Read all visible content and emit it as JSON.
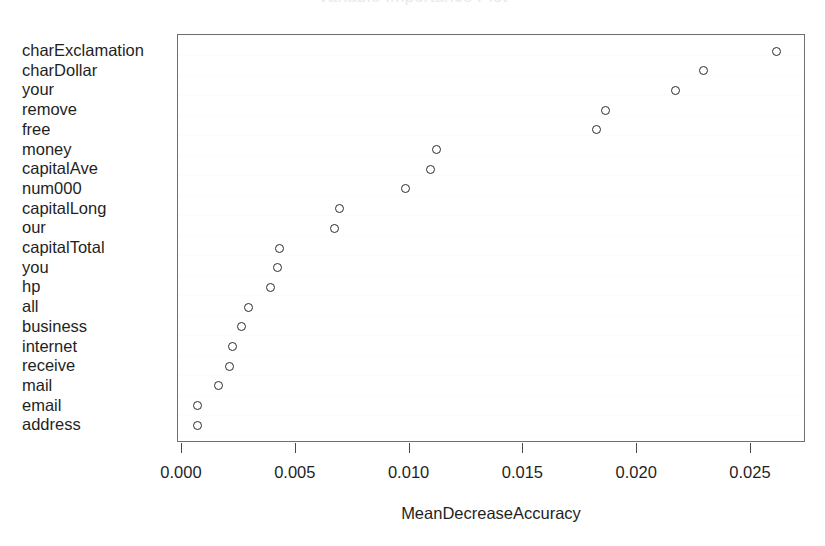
{
  "chart_data": {
    "type": "scatter",
    "subtype": "dotchart",
    "title": "Variable Importance Plot",
    "xlabel": "MeanDecreaseAccuracy",
    "ylabel": "",
    "xlim": [
      0.0,
      0.0274
    ],
    "xticks": [
      0.0,
      0.005,
      0.01,
      0.015,
      0.02,
      0.025
    ],
    "xticklabels": [
      "0.000",
      "0.005",
      "0.010",
      "0.015",
      "0.020",
      "0.025"
    ],
    "grid": false,
    "legend": null,
    "marker": "open-circle",
    "categories": [
      "charExclamation",
      "charDollar",
      "your",
      "remove",
      "free",
      "money",
      "capitalAve",
      "num000",
      "capitalLong",
      "our",
      "capitalTotal",
      "you",
      "hp",
      "all",
      "business",
      "internet",
      "receive",
      "mail",
      "email",
      "address"
    ],
    "values": [
      0.0261,
      0.0229,
      0.0217,
      0.0186,
      0.0182,
      0.0112,
      0.0109,
      0.0098,
      0.0069,
      0.0067,
      0.0043,
      0.0042,
      0.0039,
      0.0029,
      0.0026,
      0.0022,
      0.0021,
      0.0016,
      0.0007,
      0.0007
    ]
  }
}
